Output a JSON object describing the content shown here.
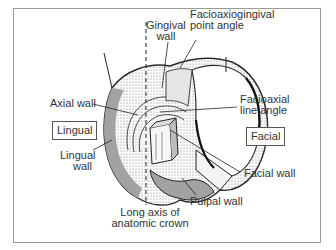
{
  "figure": {
    "surface_labels": {
      "lingual": "Lingual",
      "facial": "Facial"
    },
    "labels": {
      "gingival_wall_1": "Gingival",
      "gingival_wall_2": "wall",
      "facioaxiogingival_1": "Facioaxiogingival",
      "facioaxiogingival_2": "point angle",
      "axial_wall": "Axial wall",
      "facioaxial_1": "Facioaxial",
      "facioaxial_2": "line angle",
      "lingual_wall_1": "Lingual",
      "lingual_wall_2": "wall",
      "facial_wall": "Facial wall",
      "pulpal_wall": "Pulpal wall",
      "long_axis_1": "Long axis of",
      "long_axis_2": "anatomic crown"
    },
    "colors": {
      "frame": "#9a9a9a",
      "ink": "#2a2a2a",
      "shade": "#8c8c8c"
    }
  }
}
